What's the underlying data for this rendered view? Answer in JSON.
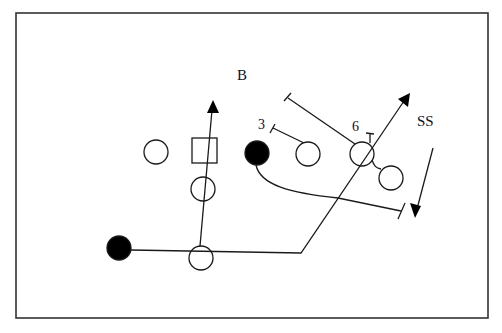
{
  "diagram": {
    "type": "football-play",
    "colors": {
      "stroke": "#1a1a1a",
      "filled": "#000000",
      "background": "#ffffff",
      "frame": "#333333"
    },
    "labels": {
      "b": "B",
      "three": "3",
      "six": "6",
      "ss": "SS"
    },
    "players": [
      {
        "id": "left-lineman",
        "shape": "circle",
        "filled": false,
        "x": 156,
        "y": 152
      },
      {
        "id": "center",
        "shape": "square",
        "filled": false,
        "x": 204,
        "y": 150
      },
      {
        "id": "filled-lineman",
        "shape": "circle",
        "filled": true,
        "x": 257,
        "y": 153
      },
      {
        "id": "tackle-3",
        "shape": "circle",
        "filled": false,
        "x": 308,
        "y": 154
      },
      {
        "id": "end-6",
        "shape": "circle",
        "filled": false,
        "x": 362,
        "y": 154
      },
      {
        "id": "wing",
        "shape": "circle",
        "filled": false,
        "x": 391,
        "y": 178
      },
      {
        "id": "quarterback",
        "shape": "circle",
        "filled": false,
        "x": 203,
        "y": 189
      },
      {
        "id": "fullback",
        "shape": "circle",
        "filled": false,
        "x": 201,
        "y": 258
      },
      {
        "id": "motion-back",
        "shape": "circle",
        "filled": true,
        "x": 119,
        "y": 248
      }
    ]
  }
}
